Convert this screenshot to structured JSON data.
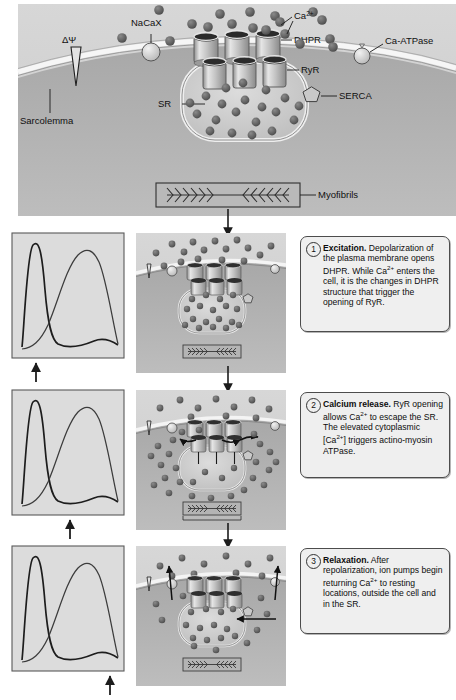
{
  "figure": {
    "type": "biological-process-diagram"
  },
  "top_panel": {
    "name": "overview-cell-diagram",
    "labels": {
      "membrane_potential": "ΔΨ",
      "sarcolemma": "Sarcolemma",
      "nacax": "NaCaX",
      "calcium": "Ca",
      "calcium_charge": "2+",
      "dhpr": "DHPR",
      "ryr": "RyR",
      "ca_atpase": "Ca-ATPase",
      "serca": "SERCA",
      "sr": "SR",
      "myofibrils": "Myofibrils"
    },
    "counts": {
      "dhpr_channels": 3,
      "ryr_channels": 3,
      "extracellular_ca_ions": 18,
      "sr_ca_ions": 20
    }
  },
  "steps": [
    {
      "number": "1",
      "bold_label": "Excitation.",
      "body": " Depolarization of the plasma membrane opens DHPR. While Ca2+ enters the cell, it is the changes in DHPR structure that trigger the opening of RyR.",
      "graph": {
        "name": "action-potential-calcium-transient-graph",
        "marker_position": "left"
      }
    },
    {
      "number": "2",
      "bold_label": "Calcium release.",
      "body": " RyR opening allows Ca2+ to escape the SR. The elevated cytoplasmic [Ca2+] triggers actino-myosin ATPase.",
      "graph": {
        "name": "action-potential-calcium-transient-graph",
        "marker_position": "center"
      }
    },
    {
      "number": "3",
      "bold_label": "Relaxation.",
      "body": " After repolarization, ion pumps begin returning Ca2+ to resting locations, outside the cell and in the SR.",
      "graph": {
        "name": "action-potential-calcium-transient-graph",
        "marker_position": "right"
      }
    }
  ],
  "chart_data": {
    "type": "line",
    "xlabel": "Time",
    "ylabel": "Amplitude",
    "grid": false,
    "legend": "none",
    "xlim": [
      0,
      100
    ],
    "ylim": [
      0,
      100
    ],
    "series": [
      {
        "name": "Action potential",
        "points": [
          [
            2,
            4
          ],
          [
            5,
            55
          ],
          [
            8,
            88
          ],
          [
            11,
            93
          ],
          [
            14,
            90
          ],
          [
            17,
            70
          ],
          [
            20,
            30
          ],
          [
            24,
            12
          ],
          [
            30,
            7
          ],
          [
            40,
            6
          ],
          [
            50,
            7
          ],
          [
            60,
            9
          ],
          [
            68,
            11
          ],
          [
            76,
            10
          ],
          [
            85,
            7
          ],
          [
            95,
            5
          ],
          [
            100,
            5
          ]
        ]
      },
      {
        "name": "Cytosolic calcium transient",
        "points": [
          [
            2,
            3
          ],
          [
            8,
            6
          ],
          [
            14,
            14
          ],
          [
            20,
            34
          ],
          [
            28,
            62
          ],
          [
            36,
            82
          ],
          [
            44,
            90
          ],
          [
            50,
            88
          ],
          [
            58,
            76
          ],
          [
            68,
            58
          ],
          [
            78,
            40
          ],
          [
            88,
            22
          ],
          [
            96,
            10
          ],
          [
            100,
            6
          ]
        ]
      }
    ],
    "markers": [
      {
        "step": 1,
        "x": 8,
        "label": "time-marker-arrow"
      },
      {
        "step": 2,
        "x": 50,
        "label": "time-marker-arrow"
      },
      {
        "step": 3,
        "x": 92,
        "label": "time-marker-arrow"
      }
    ]
  },
  "panel_states": [
    {
      "step": 1,
      "name": "cell-state-excitation",
      "sr_ca_ions": 22,
      "cytosol_ca_ions": 2,
      "extracellular_ca_ions": 16,
      "arrows": []
    },
    {
      "step": 2,
      "name": "cell-state-calcium-release",
      "sr_ca_ions": 4,
      "cytosol_ca_ions": 28,
      "extracellular_ca_ions": 12,
      "arrows": [
        "ryr-efflux-left",
        "ryr-efflux-right"
      ]
    },
    {
      "step": 3,
      "name": "cell-state-relaxation",
      "sr_ca_ions": 16,
      "cytosol_ca_ions": 14,
      "extracellular_ca_ions": 10,
      "arrows": [
        "nacax-extrusion",
        "ca-atpase-extrusion",
        "serca-uptake"
      ]
    }
  ],
  "colors": {
    "extracellular": "#d2d2d2",
    "cytoplasm": "#9a9a9a",
    "sr_lumen": "#c8c8c8",
    "membrane": "#f2f2f2",
    "ion": "#5d5d5d",
    "outline": "#3a3a3a",
    "caption_bg": "#efefef",
    "caption_border": "#4c4c4c"
  }
}
